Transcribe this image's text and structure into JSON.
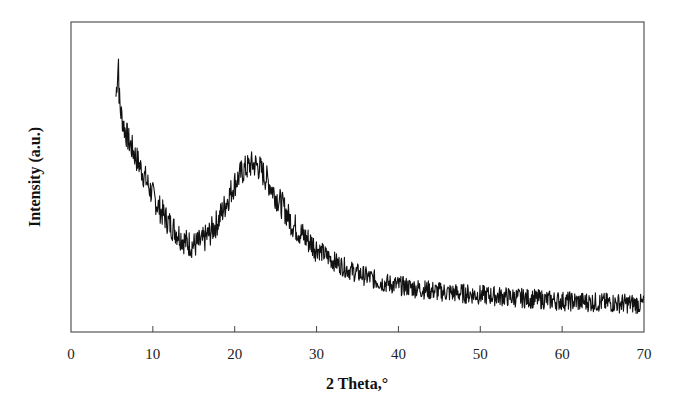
{
  "chart_data": {
    "type": "line",
    "title": "",
    "xlabel": "2 Theta,°",
    "ylabel": "Intensity (a.u.)",
    "xlim": [
      0,
      70
    ],
    "ylim": [
      0,
      100
    ],
    "x_ticks": [
      0,
      10,
      20,
      30,
      40,
      50,
      60,
      70
    ],
    "x_tick_labels": [
      "0",
      "10",
      "20",
      "30",
      "40",
      "50",
      "60",
      "70"
    ],
    "y_ticks": [],
    "grid": false,
    "legend": null,
    "series": [
      {
        "name": "XRD pattern",
        "color": "#111111",
        "noisy": true,
        "x": [
          5.5,
          5.7,
          6.0,
          6.5,
          7.0,
          8.0,
          9.0,
          10.0,
          11.0,
          12.0,
          13.0,
          14.0,
          15.0,
          16.0,
          17.0,
          18.0,
          19.0,
          20.0,
          21.0,
          22.0,
          22.5,
          23.0,
          24.0,
          25.0,
          26.0,
          27.0,
          28.0,
          30.0,
          32.0,
          34.0,
          36.0,
          38.0,
          40.0,
          45.0,
          50.0,
          55.0,
          60.0,
          65.0,
          70.0
        ],
        "y": [
          76,
          84,
          72,
          66,
          62,
          56,
          50,
          44,
          39,
          35,
          32,
          29,
          28,
          29,
          32,
          36,
          42,
          48,
          52,
          54,
          54,
          53,
          49,
          44,
          40,
          35,
          32,
          27,
          23,
          20,
          18,
          16,
          15,
          13,
          12,
          11,
          10,
          9.5,
          9
        ]
      }
    ]
  },
  "axes": {
    "xlabel": "2 Theta,°",
    "ylabel": "Intensity (a.u.)",
    "x_tick_labels": [
      "0",
      "10",
      "20",
      "30",
      "40",
      "50",
      "60",
      "70"
    ]
  }
}
